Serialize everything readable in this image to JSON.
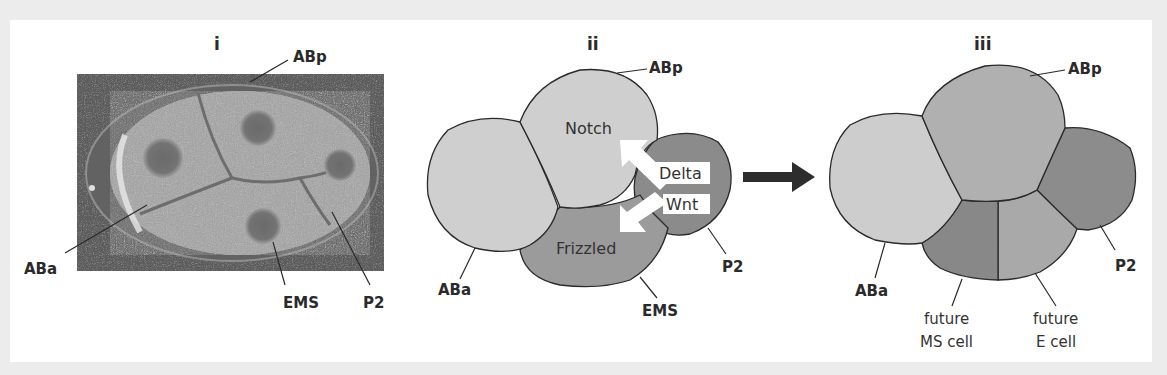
{
  "figure": {
    "panels": [
      {
        "id": "i",
        "label": "i",
        "type": "micrograph",
        "description": "DIC micrograph of 4-cell C. elegans embryo",
        "cell_labels": {
          "ABp": "ABp",
          "ABa": "ABa",
          "EMS": "EMS",
          "P2": "P2"
        }
      },
      {
        "id": "ii",
        "label": "ii",
        "type": "schematic",
        "cell_labels": {
          "ABp": "ABp",
          "ABa": "ABa",
          "EMS": "EMS",
          "P2": "P2"
        },
        "receptors": {
          "notch": "Notch",
          "frizzled": "Frizzled"
        },
        "ligands": {
          "delta": "Delta",
          "wnt": "Wnt"
        }
      },
      {
        "id": "iii",
        "label": "iii",
        "type": "schematic",
        "cell_labels": {
          "ABp": "ABp",
          "ABa": "ABa",
          "P2": "P2",
          "ms_line1": "future",
          "ms_line2": "MS cell",
          "e_line1": "future",
          "e_line2": "E cell"
        }
      }
    ],
    "transition_arrow": "right-arrow",
    "colors": {
      "background": "#ececec",
      "panel": "#ffffff",
      "ii_ABa": "#cfcfcf",
      "ii_ABp": "#cfcfcf",
      "ii_EMS": "#9b9b9b",
      "ii_P2": "#8b8b8b",
      "iii_ABa": "#cdcdcd",
      "iii_ABp": "#b0b0b0",
      "iii_P2": "#8c8c8c",
      "iii_MS": "#888888",
      "iii_E": "#a9a9a9",
      "outline": "#2a2a2a",
      "arrow": "#2d2d2d"
    }
  }
}
